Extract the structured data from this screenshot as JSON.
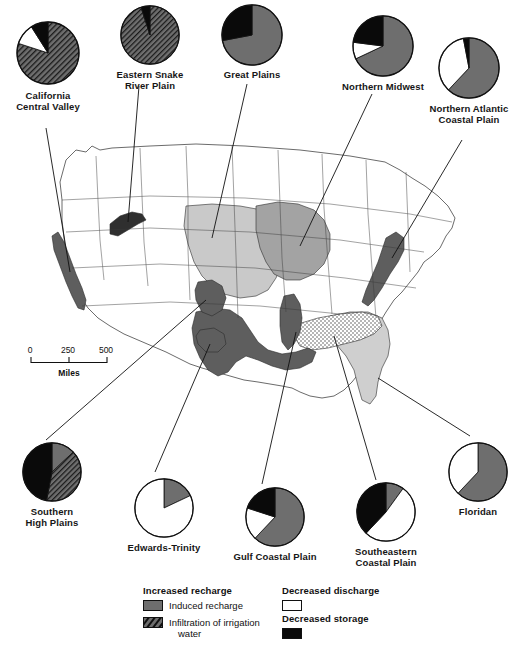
{
  "figure": {
    "title": "",
    "scale_bar": {
      "ticks": [
        "0",
        "250",
        "500"
      ],
      "unit_label": "Miles"
    }
  },
  "legend": {
    "increased_recharge": {
      "heading": "Increased recharge",
      "items": [
        {
          "label": "Induced recharge",
          "pattern": "solid-gray",
          "color": "#6e6e6e"
        },
        {
          "label": "Infiltration of irrigation",
          "label_line2": "water",
          "pattern": "hatched",
          "color": "#6e6e6e"
        }
      ]
    },
    "decreased_discharge": {
      "heading": "Decreased discharge",
      "items": [
        {
          "label": "",
          "pattern": "solid-white",
          "color": "#ffffff"
        }
      ]
    },
    "decreased_storage": {
      "heading": "Decreased storage",
      "items": [
        {
          "label": "",
          "pattern": "solid-black",
          "color": "#0a0a0a"
        }
      ]
    }
  },
  "chart_data": {
    "type": "pie",
    "legend_position": "bottom",
    "categories": [
      "Induced recharge",
      "Infiltration of irrigation water",
      "Decreased discharge",
      "Decreased storage"
    ],
    "category_styles": [
      "solid-gray",
      "hatched",
      "solid-white",
      "solid-black"
    ],
    "units": "percent",
    "charts": [
      {
        "name": "California Central Valley",
        "label": "California\nCentral Valley",
        "values": [
          0,
          80,
          11,
          9
        ]
      },
      {
        "name": "Eastern Snake River Plain",
        "label": "Eastern Snake\nRiver Plain",
        "values": [
          0,
          95,
          0,
          5
        ]
      },
      {
        "name": "Great Plains",
        "label": "Great Plains",
        "values": [
          72,
          0,
          0,
          28
        ]
      },
      {
        "name": "Northern Midwest",
        "label": "Northern Midwest",
        "values": [
          68,
          0,
          9,
          23
        ]
      },
      {
        "name": "Northern Atlantic Coastal Plain",
        "label": "Northern Atlantic\nCoastal Plain",
        "values": [
          62,
          0,
          35,
          3
        ]
      },
      {
        "name": "Southern High Plains",
        "label": "Southern\nHigh Plains",
        "values": [
          13,
          40,
          0,
          47
        ]
      },
      {
        "name": "Edwards-Trinity",
        "label": "Edwards-Trinity",
        "values": [
          18,
          0,
          82,
          0
        ]
      },
      {
        "name": "Gulf Coastal Plain",
        "label": "Gulf Coastal Plain",
        "values": [
          62,
          0,
          18,
          20
        ]
      },
      {
        "name": "Southeastern Coastal Plain",
        "label": "Southeastern\nCoastal Plain",
        "values": [
          10,
          0,
          52,
          38
        ]
      },
      {
        "name": "Floridan",
        "label": "Floridan",
        "values": [
          62,
          0,
          38,
          0
        ]
      }
    ]
  },
  "map": {
    "regions": [
      {
        "name": "California Central Valley",
        "fill": "dark-gray"
      },
      {
        "name": "Eastern Snake River Plain",
        "fill": "dark-gray"
      },
      {
        "name": "Great Plains",
        "fill": "light-gray"
      },
      {
        "name": "Northern Midwest",
        "fill": "medium-gray"
      },
      {
        "name": "Northern Atlantic Coastal Plain",
        "fill": "dark-gray"
      },
      {
        "name": "Southern High Plains",
        "fill": "dark-gray"
      },
      {
        "name": "Edwards-Trinity",
        "fill": "dark-gray"
      },
      {
        "name": "Gulf Coastal Plain",
        "fill": "dark-gray"
      },
      {
        "name": "Southeastern Coastal Plain",
        "fill": "stippled"
      },
      {
        "name": "Floridan",
        "fill": "light-gray"
      }
    ]
  },
  "colors": {
    "induced_recharge": "#6e6e6e",
    "irrigation_infiltration": "#6e6e6e",
    "decreased_discharge": "#ffffff",
    "decreased_storage": "#0a0a0a",
    "outline": "#111111",
    "map_light": "#c9c9c9",
    "map_medium": "#a3a3a3",
    "map_dark": "#5e5e5e",
    "background": "#ffffff"
  }
}
